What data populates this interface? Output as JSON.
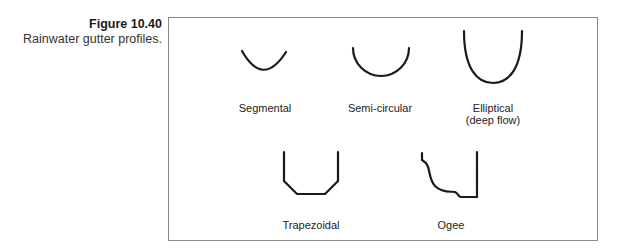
{
  "caption": {
    "figure_number": "Figure 10.40",
    "title": "Rainwater gutter profiles."
  },
  "profiles": [
    {
      "id": "segmental",
      "label": "Segmental"
    },
    {
      "id": "semi-circular",
      "label": "Semi-circular"
    },
    {
      "id": "elliptical",
      "label": "Elliptical",
      "sublabel": "(deep flow)"
    },
    {
      "id": "trapezoidal",
      "label": "Trapezoidal"
    },
    {
      "id": "ogee",
      "label": "Ogee"
    }
  ],
  "colors": {
    "stroke": "#1a1a1a",
    "frame": "#8a8a8a"
  }
}
